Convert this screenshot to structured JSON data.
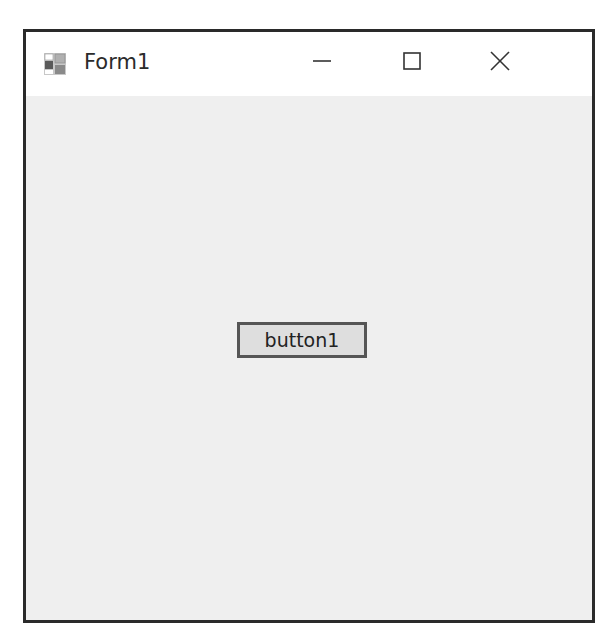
{
  "window": {
    "title": "Form1",
    "icon": "winforms-app-icon",
    "controls": {
      "minimize": "minimize-icon",
      "maximize": "maximize-icon",
      "close": "close-icon"
    }
  },
  "form": {
    "button_label": "button1"
  },
  "colors": {
    "client_background": "#efefef",
    "button_face": "#dedede",
    "button_border": "#555555",
    "window_border": "#2a2a2a"
  }
}
